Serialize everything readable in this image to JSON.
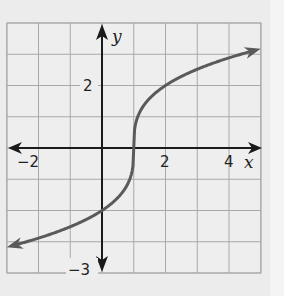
{
  "chart_data": {
    "type": "line",
    "title": "",
    "xlabel": "x",
    "ylabel": "y",
    "xlim": [
      -3,
      5
    ],
    "ylim": [
      -4,
      4
    ],
    "grid": true,
    "x_tick_labels": [
      "-2",
      "2",
      "4"
    ],
    "y_tick_labels": [
      "2",
      "-3"
    ],
    "series": [
      {
        "name": "y = 2∛(x − 1)",
        "x": [
          -3,
          -2,
          -1,
          0,
          0.5,
          1,
          1.5,
          2,
          3,
          4,
          5
        ],
        "y": [
          -3.17,
          -2.88,
          -2.52,
          -2,
          -1.59,
          0,
          1.59,
          2,
          2.52,
          2.88,
          3.17
        ]
      }
    ],
    "annotations": [
      "arrows on both ends of curve",
      "arrows on both ends of axes"
    ]
  },
  "labels": {
    "x_axis": "x",
    "y_axis": "y",
    "tick_neg2": "−2",
    "tick_2x": "2",
    "tick_4x": "4",
    "tick_2y": "2",
    "tick_neg3y": "−3"
  },
  "colors": {
    "grid": "#a9a9a9",
    "axis": "#1a1a1a",
    "curve": "#5a5a5a",
    "background": "#ececec"
  }
}
